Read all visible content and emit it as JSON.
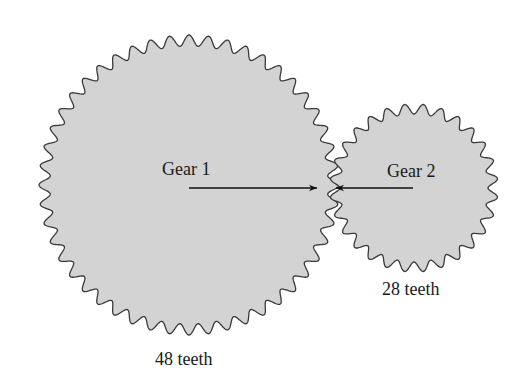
{
  "diagram": {
    "gears": [
      {
        "label": "Gear 1",
        "teeth_label": "48 teeth",
        "teeth": 48
      },
      {
        "label": "Gear 2",
        "teeth_label": "28 teeth",
        "teeth": 28
      }
    ],
    "colors": {
      "fill": "#d3d3d3",
      "stroke": "#3a3a3a",
      "arrow": "#111111"
    }
  }
}
